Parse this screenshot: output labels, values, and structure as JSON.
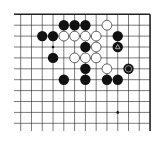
{
  "board": {
    "description": "Go board diagram, top-right corner view",
    "columns": 13,
    "rows": 11,
    "x_origin": 20.7,
    "y_origin": 14.3,
    "spacing_x": 10.78,
    "spacing_y": 10.9,
    "edges": {
      "top": true,
      "right": true,
      "left": false,
      "bottom": false
    },
    "line_color": "#222222",
    "star_points": [
      [
        3,
        3
      ],
      [
        3,
        9
      ],
      [
        9,
        9
      ]
    ],
    "stones": [
      {
        "col": 4,
        "row": 1,
        "color": "black"
      },
      {
        "col": 5,
        "row": 1,
        "color": "black"
      },
      {
        "col": 6,
        "row": 1,
        "color": "black"
      },
      {
        "col": 8,
        "row": 1,
        "color": "white"
      },
      {
        "col": 2,
        "row": 2,
        "color": "black"
      },
      {
        "col": 3,
        "row": 2,
        "color": "black"
      },
      {
        "col": 4,
        "row": 2,
        "color": "white"
      },
      {
        "col": 5,
        "row": 2,
        "color": "white"
      },
      {
        "col": 6,
        "row": 2,
        "color": "white"
      },
      {
        "col": 7,
        "row": 2,
        "color": "white"
      },
      {
        "col": 9,
        "row": 2,
        "color": "black"
      },
      {
        "col": 6,
        "row": 3,
        "color": "black"
      },
      {
        "col": 7,
        "row": 3,
        "color": "white"
      },
      {
        "col": 9,
        "row": 3,
        "color": "black",
        "mark": "triangle"
      },
      {
        "col": 3,
        "row": 4,
        "color": "black"
      },
      {
        "col": 5,
        "row": 4,
        "color": "white"
      },
      {
        "col": 6,
        "row": 4,
        "color": "white"
      },
      {
        "col": 7,
        "row": 4,
        "color": "white"
      },
      {
        "col": 6,
        "row": 5,
        "color": "black"
      },
      {
        "col": 8,
        "row": 5,
        "color": "white"
      },
      {
        "col": 10,
        "row": 5,
        "color": "black",
        "mark": "circle"
      },
      {
        "col": 4,
        "row": 6,
        "color": "black"
      },
      {
        "col": 6,
        "row": 6,
        "color": "black"
      },
      {
        "col": 8,
        "row": 6,
        "color": "black"
      },
      {
        "col": 9,
        "row": 6,
        "color": "black"
      }
    ]
  }
}
